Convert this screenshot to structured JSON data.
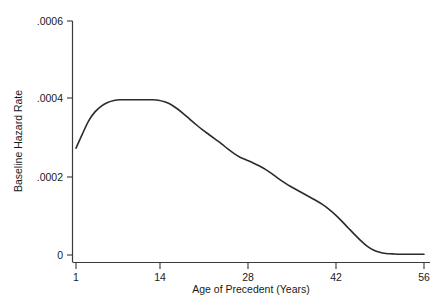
{
  "chart_data": {
    "type": "line",
    "title": "",
    "subtitle": "",
    "xlabel": "Age of Precedent (Years)",
    "ylabel": "Baseline Hazard Rate",
    "xlim": [
      1,
      56
    ],
    "ylim": [
      0,
      0.0006
    ],
    "grid": false,
    "legend": "none",
    "xticks": [
      1,
      14,
      28,
      42,
      56
    ],
    "xticklabels": [
      "1",
      "14",
      "28",
      "42",
      "56"
    ],
    "yticks": [
      0,
      0.0002,
      0.0004,
      0.0006
    ],
    "yticklabels": [
      "0",
      ".0002",
      ".0004",
      ".0006"
    ],
    "series": [
      {
        "name": "Baseline Hazard Rate",
        "color": "#2b2b2b",
        "x": [
          1,
          2,
          3,
          4,
          5,
          6,
          7,
          8,
          9,
          10,
          11,
          12,
          13,
          14,
          15,
          16,
          17,
          18,
          19,
          20,
          21,
          22,
          23,
          24,
          25,
          26,
          27,
          28,
          29,
          30,
          31,
          32,
          33,
          34,
          35,
          36,
          37,
          38,
          39,
          40,
          41,
          42,
          43,
          44,
          45,
          46,
          47,
          48,
          49,
          50,
          51,
          52,
          53,
          54,
          55,
          56
        ],
        "values": [
          0.000274,
          0.00031,
          0.000344,
          0.000367,
          0.000382,
          0.000391,
          0.000396,
          0.000398,
          0.000398,
          0.000398,
          0.000398,
          0.000398,
          0.000398,
          0.000397,
          0.000393,
          0.000386,
          0.000375,
          0.000362,
          0.000348,
          0.000334,
          0.000321,
          0.000309,
          0.000297,
          0.000285,
          0.000272,
          0.00026,
          0.00025,
          0.000243,
          0.000236,
          0.000228,
          0.000219,
          0.000208,
          0.000196,
          0.000185,
          0.000175,
          0.000166,
          0.000157,
          0.000148,
          0.000139,
          0.000129,
          0.000117,
          0.000103,
          8.7e-05,
          7e-05,
          5.3e-05,
          3.7e-05,
          2.3e-05,
          1.3e-05,
          7e-06,
          4e-06,
          3e-06,
          2e-06,
          2e-06,
          2e-06,
          2e-06,
          2e-06
        ]
      }
    ]
  },
  "axes": {
    "y_axis_label": "Baseline Hazard Rate",
    "x_axis_label": "Age of Precedent (Years)"
  }
}
